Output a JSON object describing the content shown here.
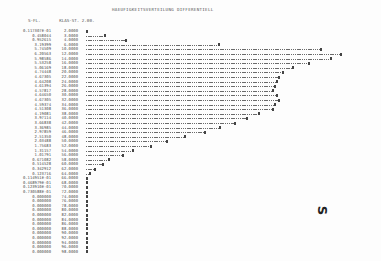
{
  "document": {
    "title": "HAEUFIGKEITSVERTEILUNG DIFFERENTIELL",
    "subheader": {
      "col1": "S-FL.",
      "col2": "KLAS-ST. 2.00."
    },
    "margin_mark": "S"
  },
  "rows": [
    {
      "freq": "0.117307E-01",
      "cls": "2.0000",
      "bar": 0
    },
    {
      "freq": "0.458044",
      "cls": "3.0000",
      "bar": 18
    },
    {
      "freq": "0.952615",
      "cls": "4.0000",
      "bar": 39
    },
    {
      "freq": "3.19399",
      "cls": "6.0000",
      "bar": 132
    },
    {
      "freq": "5.74509",
      "cls": "10.0000",
      "bar": 234
    },
    {
      "freq": "6.20563",
      "cls": "12.0000",
      "bar": 254
    },
    {
      "freq": "5.98586",
      "cls": "14.0000",
      "bar": 244
    },
    {
      "freq": "5.53258",
      "cls": "16.0000",
      "bar": 222
    },
    {
      "freq": "5.06169",
      "cls": "18.0000",
      "bar": 206
    },
    {
      "freq": "4.74448",
      "cls": "20.0000",
      "bar": 196
    },
    {
      "freq": "4.67305",
      "cls": "22.0000",
      "bar": 192
    },
    {
      "freq": "4.64208",
      "cls": "24.0000",
      "bar": 190
    },
    {
      "freq": "4.61394",
      "cls": "26.0000",
      "bar": 188
    },
    {
      "freq": "4.57817",
      "cls": "28.0000",
      "bar": 186
    },
    {
      "freq": "4.64650",
      "cls": "30.0000",
      "bar": 190
    },
    {
      "freq": "4.67305",
      "cls": "32.0000",
      "bar": 192
    },
    {
      "freq": "4.59374",
      "cls": "34.0000",
      "bar": 188
    },
    {
      "freq": "4.51308",
      "cls": "36.0000",
      "bar": 186
    },
    {
      "freq": "4.19081",
      "cls": "38.0000",
      "bar": 172
    },
    {
      "freq": "3.97114",
      "cls": "40.0000",
      "bar": 160
    },
    {
      "freq": "3.66838",
      "cls": "42.0000",
      "bar": 148
    },
    {
      "freq": "3.36985",
      "cls": "44.0000",
      "bar": 133
    },
    {
      "freq": "2.97859",
      "cls": "46.0000",
      "bar": 118
    },
    {
      "freq": "2.51350",
      "cls": "48.0000",
      "bar": 98
    },
    {
      "freq": "2.03488",
      "cls": "50.0000",
      "bar": 80
    },
    {
      "freq": "1.75683",
      "cls": "52.0000",
      "bar": 64
    },
    {
      "freq": "1.31157",
      "cls": "54.0000",
      "bar": 46
    },
    {
      "freq": "1.01791",
      "cls": "56.0000",
      "bar": 36
    },
    {
      "freq": "0.671082",
      "cls": "58.0000",
      "bar": 22
    },
    {
      "freq": "0.514528",
      "cls": "60.0000",
      "bar": 16
    },
    {
      "freq": "0.342912",
      "cls": "62.0000",
      "bar": 8
    },
    {
      "freq": "0.123716",
      "cls": "64.0000",
      "bar": 3
    },
    {
      "freq": "0.114951E-01",
      "cls": "66.0000",
      "bar": 0
    },
    {
      "freq": "0.468979E-01",
      "cls": "68.0000",
      "bar": 0
    },
    {
      "freq": "0.123910E-01",
      "cls": "70.0000",
      "bar": 0
    },
    {
      "freq": "0.730588E-01",
      "cls": "72.0000",
      "bar": 0
    },
    {
      "freq": "0.000000",
      "cls": "74.0000",
      "bar": 0
    },
    {
      "freq": "0.000000",
      "cls": "76.0000",
      "bar": 0
    },
    {
      "freq": "0.000000",
      "cls": "78.0000",
      "bar": 0
    },
    {
      "freq": "0.000000",
      "cls": "80.0000",
      "bar": 0
    },
    {
      "freq": "0.000000",
      "cls": "82.0000",
      "bar": 0
    },
    {
      "freq": "0.000000",
      "cls": "84.0000",
      "bar": 0
    },
    {
      "freq": "0.000000",
      "cls": "86.0000",
      "bar": 0
    },
    {
      "freq": "0.000000",
      "cls": "88.0000",
      "bar": 0
    },
    {
      "freq": "0.000000",
      "cls": "90.0000",
      "bar": 0
    },
    {
      "freq": "0.000000",
      "cls": "92.0000",
      "bar": 0
    },
    {
      "freq": "0.000000",
      "cls": "94.0000",
      "bar": 0
    },
    {
      "freq": "0.000000",
      "cls": "96.0000",
      "bar": 0
    },
    {
      "freq": "0.000000",
      "cls": "98.0000",
      "bar": 0
    }
  ]
}
